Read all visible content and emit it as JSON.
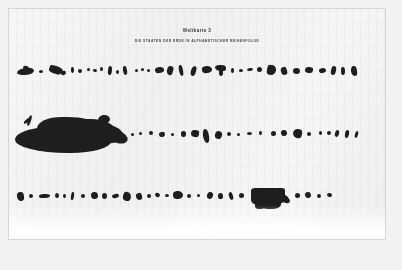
{
  "document": {
    "kind": "scanned-poster-page",
    "title": "Weltkarte 3",
    "subtitle": "DIE STAATEN DER ERDE IN ALPHABETISCHER REIHENFOLGE",
    "language": "de"
  },
  "colors": {
    "scan_backdrop": "#f2f2f3",
    "paper": "#eff0f0",
    "ink": "#1d1e20",
    "title_text": "#3a3c3f",
    "subtitle_text": "#46484b",
    "paper_border": "#bec0c2"
  },
  "rows": [
    {
      "index": 1,
      "name": "row-1",
      "description": "Erste Reihe der Landesumrisse",
      "shape_count": 31
    },
    {
      "index": 2,
      "name": "row-2",
      "description": "Zweite Reihe der Landesumrisse",
      "shape_count": 26
    },
    {
      "index": 3,
      "name": "row-3",
      "description": "Dritte Reihe der Landesumrisse",
      "shape_count": 30
    }
  ]
}
